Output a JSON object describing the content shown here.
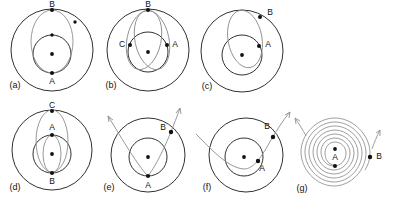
{
  "figure": {
    "width": 393,
    "height": 202,
    "background": "#ffffff",
    "orbit_color": "#1a1a1a",
    "trajectory_color": "#8d8d8d",
    "marker_color": "#111111"
  },
  "panels": [
    {
      "id": "a",
      "label": "(a)",
      "points": [
        {
          "name": "B",
          "label": "B",
          "position": "top-of-outer-circle"
        },
        {
          "name": "A",
          "label": "A",
          "position": "bottom-of-inner-circle"
        }
      ],
      "description": "outer circle, inner circle, central body, transfer ellipse from A to B"
    },
    {
      "id": "b",
      "label": "(b)",
      "points": [
        {
          "name": "B",
          "label": "B",
          "position": "top-of-outer-circle"
        },
        {
          "name": "A",
          "label": "A",
          "position": "right-of-inner-circle"
        },
        {
          "name": "C",
          "label": "C",
          "position": "left-of-inner-circle"
        }
      ],
      "description": "outer circle, inner circle, central body, two ellipse arcs A to B to C"
    },
    {
      "id": "c",
      "label": "(c)",
      "points": [
        {
          "name": "B",
          "label": "B",
          "position": "upper-right-of-outer-circle"
        },
        {
          "name": "A",
          "label": "A",
          "position": "upper-right-of-inner-circle"
        }
      ],
      "description": "outer circle, inner circle, central body, narrow tilted ellipse from A to B"
    },
    {
      "id": "d",
      "label": "(d)",
      "points": [
        {
          "name": "C",
          "label": "C",
          "position": "top-of-outer-circle"
        },
        {
          "name": "A",
          "label": "A",
          "position": "top-of-inner-circle"
        },
        {
          "name": "B",
          "label": "B",
          "position": "bottom-of-inner-circle"
        }
      ],
      "description": "outer circle, inner circle, central body, two nested ellipses through A, B and C"
    },
    {
      "id": "e",
      "label": "(e)",
      "points": [
        {
          "name": "A",
          "label": "A",
          "position": "bottom-of-inner-circle"
        },
        {
          "name": "B",
          "label": "B",
          "position": "upper-right-of-outer-circle"
        }
      ],
      "description": "outer circle, inner circle, central body, open escape trajectory with two arrow tips"
    },
    {
      "id": "f",
      "label": "(f)",
      "points": [
        {
          "name": "B",
          "label": "B",
          "position": "upper-right-of-outer-circle"
        },
        {
          "name": "A",
          "label": "A",
          "position": "lower-right-of-inner-circle"
        }
      ],
      "description": "outer circle, inner circle, central body, single open hyperbolic flyby through A and B"
    },
    {
      "id": "g",
      "label": "(g)",
      "points": [
        {
          "name": "A",
          "label": "A",
          "position": "below-central-body"
        },
        {
          "name": "B",
          "label": "B",
          "position": "right-edge-of-spiral"
        }
      ],
      "description": "outward spiral trajectory of many turns from A to B with arrow tips"
    }
  ]
}
